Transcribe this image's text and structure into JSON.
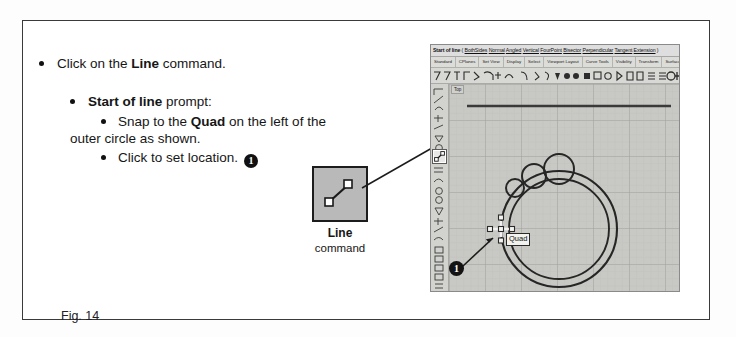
{
  "figure": {
    "caption": "Fig. 14"
  },
  "instructions": {
    "step1": {
      "text_before": "Click on the ",
      "bold": "Line",
      "text_after": " command."
    },
    "step2": {
      "bold": "Start of line",
      "text_after": " prompt:"
    },
    "step2a": {
      "text_before": "Snap to the ",
      "bold": "Quad",
      "text_after": " on the left of the",
      "continuation": "outer circle as shown."
    },
    "step2b": {
      "text": "Click to set location.",
      "badge": "1"
    }
  },
  "line_callout": {
    "title": "Line",
    "subtitle": "command",
    "icon": "line-tool-icon"
  },
  "rhino": {
    "command_bar": {
      "prompt": "Start of line",
      "separator_open": " (",
      "options": [
        "BothSides",
        "Normal",
        "Angled",
        "Vertical",
        "FourPoint",
        "Bisector",
        "Perpendicular",
        "Tangent",
        "Extension"
      ],
      "separator_close": " )"
    },
    "toolbar_tabs": [
      "Standard",
      "CPlanes",
      "Set View",
      "Display",
      "Select",
      "Viewport Layout",
      "Curve Tools",
      "Visibility",
      "Transform",
      "Surface Tools",
      "Solid Tools"
    ],
    "viewport": {
      "label": "Top",
      "osnap_tooltip": "Quad",
      "marker": "1"
    }
  },
  "colors": {
    "frame": "#3a3a3a",
    "callout_fill": "#b9b9b9",
    "app_chrome": "#d4d4d0",
    "viewport_bg": "#c8c8c4",
    "grid_minor": "#bdbdb9",
    "grid_major": "#9a9a96",
    "geometry": "#2b2b2b",
    "badge": "#131313"
  }
}
